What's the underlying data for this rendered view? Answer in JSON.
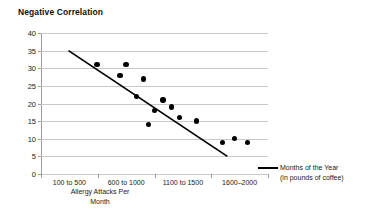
{
  "chart_data": {
    "type": "scatter",
    "title": "Negative Correlation",
    "xlabel": "Allergy Attacks Per Month",
    "xlabel_line1": "Allergy Attacks Per",
    "xlabel_line2": "Month",
    "ylabel": "",
    "ylim": [
      0,
      40
    ],
    "grid": true,
    "y_ticks": [
      40,
      35,
      30,
      25,
      20,
      15,
      10,
      5,
      0
    ],
    "categories": [
      "100 to 500",
      "600 to 1000",
      "1100 to 1500",
      "1600–2000"
    ],
    "x_range_numeric": [
      100,
      2000
    ],
    "legend_position": "right",
    "legend": [
      {
        "name": "Months of the Year",
        "sublabel": "(in pounds of coffee)",
        "marker": "line",
        "color": "#000000"
      }
    ],
    "points": [
      {
        "x": 570,
        "y": 31
      },
      {
        "x": 760,
        "y": 28
      },
      {
        "x": 810,
        "y": 31
      },
      {
        "x": 960,
        "y": 27
      },
      {
        "x": 900,
        "y": 22
      },
      {
        "x": 1120,
        "y": 21
      },
      {
        "x": 1050,
        "y": 18
      },
      {
        "x": 1190,
        "y": 19
      },
      {
        "x": 1000,
        "y": 14
      },
      {
        "x": 1260,
        "y": 16
      },
      {
        "x": 1400,
        "y": 15
      },
      {
        "x": 1620,
        "y": 9
      },
      {
        "x": 1720,
        "y": 10
      },
      {
        "x": 1830,
        "y": 9
      }
    ],
    "trendline": {
      "color": "#000000",
      "x_start": 330,
      "y_start": 35,
      "x_end": 1660,
      "y_end": 5
    }
  }
}
